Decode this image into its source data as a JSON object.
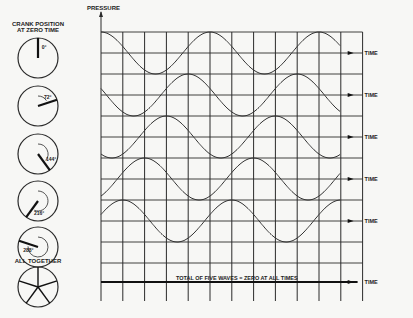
{
  "crank_panel": {
    "title_line1": "CRANK POSITION",
    "title_line2": "AT ZERO TIME",
    "cranks": [
      {
        "label": "0°",
        "angle_deg": 0
      },
      {
        "label": "72°",
        "angle_deg": 72
      },
      {
        "label": "144°",
        "angle_deg": 144
      },
      {
        "label": "216°",
        "angle_deg": 216
      },
      {
        "label": "288°",
        "angle_deg": 288
      }
    ],
    "together_label": "ALL TOGETHER"
  },
  "chart": {
    "y_axis_label": "PRESSURE",
    "time_label": "TIME",
    "total_caption": "TOTAL OF FIVE WAVES = ZERO AT ALL TIMES"
  },
  "chart_data": {
    "type": "line",
    "title": "",
    "ylabel": "PRESSURE",
    "xlabel": "TIME",
    "grid": true,
    "series": [
      {
        "name": "Wave 1 (0°)",
        "phase_deg": 0,
        "amplitude": 1,
        "periods_shown": 2.5
      },
      {
        "name": "Wave 2 (72°)",
        "phase_deg": 72,
        "amplitude": 1,
        "periods_shown": 2.5
      },
      {
        "name": "Wave 3 (144°)",
        "phase_deg": 144,
        "amplitude": 1,
        "periods_shown": 2.5
      },
      {
        "name": "Wave 4 (216°)",
        "phase_deg": 216,
        "amplitude": 1,
        "periods_shown": 2.5
      },
      {
        "name": "Wave 5 (288°)",
        "phase_deg": 288,
        "amplitude": 1,
        "periods_shown": 2.5
      },
      {
        "name": "Total of five waves",
        "constant_value": 0
      }
    ],
    "annotations": [
      "TOTAL OF FIVE WAVES = ZERO AT ALL TIMES"
    ]
  }
}
